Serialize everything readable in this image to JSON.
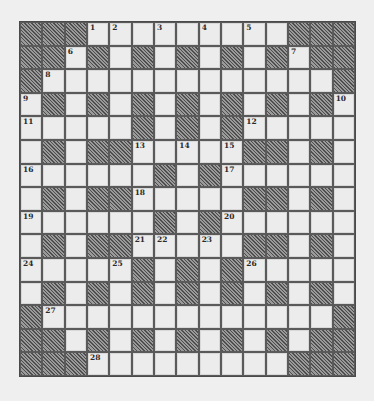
{
  "puzzle": {
    "rows": 15,
    "cols": 15,
    "legend": {
      "#": "block",
      ".": "white"
    },
    "grid": [
      "###....:...###",
      "",
      "",
      "",
      "",
      "",
      "",
      "",
      "",
      "",
      "",
      "",
      "",
      "",
      ""
    ],
    "layout": [
      [
        "#",
        "#",
        "#",
        "1",
        "2",
        ".",
        "3",
        ".",
        "4",
        ".",
        "5",
        ".",
        "#",
        "#",
        "#"
      ],
      [
        "#",
        "#",
        "6",
        "#",
        ".",
        "#",
        ".",
        "#",
        ".",
        "#",
        ".",
        "#",
        "7",
        "#",
        "#"
      ],
      [
        "#",
        "8",
        ".",
        ".",
        ".",
        ".",
        ".",
        ".",
        ".",
        ".",
        ".",
        ".",
        ".",
        ".",
        "#"
      ],
      [
        "9",
        "#",
        ".",
        "#",
        ".",
        "#",
        ".",
        "#",
        ".",
        "#",
        ".",
        "#",
        ".",
        "#",
        "10"
      ],
      [
        "11",
        ".",
        ".",
        ".",
        ".",
        "#",
        ".",
        "#",
        ".",
        "#",
        "12",
        ".",
        ".",
        ".",
        "."
      ],
      [
        ".",
        "#",
        ".",
        "#",
        "#",
        "13",
        ".",
        "14",
        ".",
        "15",
        "#",
        "#",
        ".",
        "#",
        "."
      ],
      [
        "16",
        ".",
        ".",
        ".",
        ".",
        ".",
        "#",
        ".",
        "#",
        "17",
        ".",
        ".",
        ".",
        ".",
        "."
      ],
      [
        ".",
        "#",
        ".",
        "#",
        "#",
        "18",
        ".",
        ".",
        ".",
        ".",
        "#",
        "#",
        ".",
        "#",
        "."
      ],
      [
        "19",
        ".",
        ".",
        ".",
        ".",
        ".",
        "#",
        ".",
        "#",
        "20",
        ".",
        ".",
        ".",
        ".",
        "."
      ],
      [
        ".",
        "#",
        ".",
        "#",
        "#",
        "21",
        "22",
        ".",
        "23",
        ".",
        "#",
        "#",
        ".",
        "#",
        "."
      ],
      [
        "24",
        ".",
        ".",
        ".",
        "25",
        "#",
        ".",
        "#",
        ".",
        "#",
        "26",
        ".",
        ".",
        ".",
        "."
      ],
      [
        ".",
        "#",
        ".",
        "#",
        ".",
        "#",
        ".",
        "#",
        ".",
        "#",
        ".",
        "#",
        ".",
        "#",
        "."
      ],
      [
        "#",
        "27",
        ".",
        ".",
        ".",
        ".",
        ".",
        ".",
        ".",
        ".",
        ".",
        ".",
        ".",
        ".",
        "#"
      ],
      [
        "#",
        "#",
        ".",
        "#",
        ".",
        "#",
        ".",
        "#",
        ".",
        "#",
        ".",
        "#",
        ".",
        "#",
        "#"
      ],
      [
        "#",
        "#",
        "#",
        "28",
        ".",
        ".",
        ".",
        ".",
        ".",
        ".",
        ".",
        ".",
        "#",
        "#",
        "#"
      ]
    ],
    "clue_numbers": [
      1,
      2,
      3,
      4,
      5,
      6,
      7,
      8,
      9,
      10,
      11,
      12,
      13,
      14,
      15,
      16,
      17,
      18,
      19,
      20,
      21,
      22,
      23,
      24,
      25,
      26,
      27,
      28
    ],
    "colors": {
      "background": "#efefef",
      "cell_fill": "#ececec",
      "cell_border": "#5a5a5a",
      "block_dark": "#4e4e4e",
      "block_light": "#9a9a9a",
      "number_text": "#2a2a2a"
    }
  }
}
